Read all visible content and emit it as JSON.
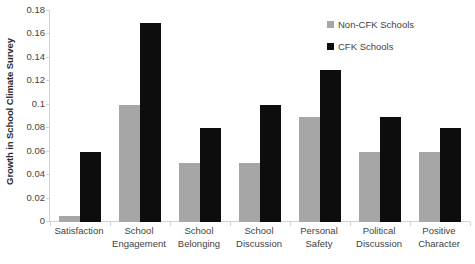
{
  "chart_data": {
    "type": "bar",
    "title": "",
    "subtitle": "",
    "xlabel": "",
    "ylabel": "Growth in School Climate Survey",
    "ylim": [
      0,
      0.18
    ],
    "ytick_labels": [
      "0.18",
      "0.16",
      "0.14",
      "0.12",
      "0.1",
      "0.08",
      "0.06",
      "0.04",
      "0.02",
      "0"
    ],
    "ytick_values": [
      0.18,
      0.16,
      0.14,
      0.12,
      0.1,
      0.08,
      0.06,
      0.04,
      0.02,
      0
    ],
    "grid": false,
    "legend_position": "top-right",
    "categories": [
      "Satisfaction",
      "School Engagement",
      "School Belonging",
      "School Discussion",
      "Personal Safety",
      "Political Discussion",
      "Positive Character"
    ],
    "series": [
      {
        "name": "Non-CFK Schools",
        "color": "#a6a6a6",
        "values": [
          0.005,
          0.1,
          0.05,
          0.05,
          0.09,
          0.06,
          0.06
        ]
      },
      {
        "name": "CFK Schools",
        "color": "#0d0d0d",
        "values": [
          0.06,
          0.17,
          0.08,
          0.1,
          0.13,
          0.09,
          0.08
        ]
      }
    ]
  },
  "legend": {
    "entries": [
      {
        "label": "Non-CFK Schools"
      },
      {
        "label": "CFK Schools"
      }
    ]
  },
  "axis": {
    "y_title": "Growth in School Climate Survey"
  }
}
